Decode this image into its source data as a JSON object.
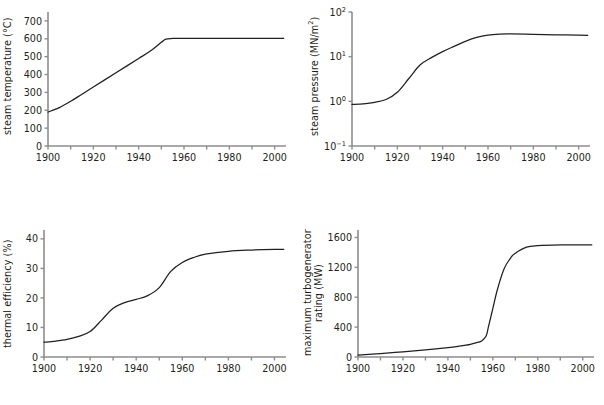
{
  "figure": {
    "caption": "",
    "panel_count": 4
  },
  "chart_data": [
    {
      "id": "steam-temperature",
      "type": "line",
      "title": "",
      "xlabel": "",
      "ylabel": "steam temperature (°C)",
      "xlim": [
        1900,
        2005
      ],
      "ylim": [
        0,
        750
      ],
      "xticks": [
        1900,
        1910,
        1920,
        1930,
        1940,
        1950,
        1960,
        1970,
        1980,
        1990,
        2000
      ],
      "xticklabels": [
        "1900",
        "",
        "1920",
        "",
        "1940",
        "",
        "1960",
        "",
        "1980",
        "",
        "2000"
      ],
      "yticks": [
        0,
        100,
        200,
        300,
        400,
        500,
        600,
        700
      ],
      "yticklabels": [
        "0",
        "100",
        "200",
        "300",
        "400",
        "500",
        "600",
        "700"
      ],
      "yscale": "linear",
      "grid": false,
      "legend": "none",
      "x": [
        1900,
        1905,
        1910,
        1915,
        1920,
        1925,
        1930,
        1935,
        1940,
        1945,
        1950,
        1952,
        1955,
        1960,
        1970,
        1980,
        1990,
        2000,
        2004
      ],
      "y": [
        190,
        215,
        250,
        290,
        330,
        370,
        410,
        450,
        490,
        530,
        580,
        598,
        602,
        603,
        603,
        603,
        603,
        603,
        603
      ]
    },
    {
      "id": "steam-pressure",
      "type": "line",
      "title": "",
      "xlabel": "",
      "ylabel": "steam pressure (MN/m2)",
      "xlim": [
        1900,
        2005
      ],
      "ylim": [
        0.1,
        100
      ],
      "xticks": [
        1900,
        1910,
        1920,
        1930,
        1940,
        1950,
        1960,
        1970,
        1980,
        1990,
        2000
      ],
      "xticklabels": [
        "1900",
        "",
        "1920",
        "",
        "1940",
        "",
        "1960",
        "",
        "1980",
        "",
        "2000"
      ],
      "yticks": [
        0.1,
        1,
        10,
        100
      ],
      "yticklabels": [
        "10-1",
        "100",
        "101",
        "102"
      ],
      "yscale": "log",
      "grid": false,
      "legend": "none",
      "x": [
        1900,
        1905,
        1910,
        1915,
        1920,
        1925,
        1930,
        1935,
        1940,
        1945,
        1950,
        1955,
        1960,
        1965,
        1970,
        1980,
        1990,
        2000,
        2004
      ],
      "y": [
        0.85,
        0.88,
        0.95,
        1.1,
        1.6,
        3.2,
        6.5,
        9.5,
        13,
        17,
        22,
        27,
        30.5,
        32,
        32.2,
        31.5,
        30.8,
        30.2,
        30
      ]
    },
    {
      "id": "thermal-efficiency",
      "type": "line",
      "title": "",
      "xlabel": "",
      "ylabel": "thermal efficiency (%)",
      "xlim": [
        1900,
        2005
      ],
      "ylim": [
        0,
        43
      ],
      "xticks": [
        1900,
        1910,
        1920,
        1930,
        1940,
        1950,
        1960,
        1970,
        1980,
        1990,
        2000
      ],
      "xticklabels": [
        "1900",
        "",
        "1920",
        "",
        "1940",
        "",
        "1960",
        "",
        "1980",
        "",
        "2000"
      ],
      "yticks": [
        0,
        10,
        20,
        30,
        40
      ],
      "yticklabels": [
        "0",
        "10",
        "20",
        "30",
        "40"
      ],
      "yscale": "linear",
      "grid": false,
      "legend": "none",
      "x": [
        1900,
        1905,
        1910,
        1915,
        1920,
        1925,
        1930,
        1935,
        1940,
        1945,
        1950,
        1955,
        1960,
        1965,
        1970,
        1980,
        1990,
        2000,
        2004
      ],
      "y": [
        5.0,
        5.4,
        6.0,
        7.0,
        8.6,
        12.5,
        16.5,
        18.4,
        19.5,
        20.8,
        23.5,
        29.0,
        32.0,
        33.7,
        34.8,
        35.8,
        36.2,
        36.4,
        36.4
      ]
    },
    {
      "id": "turbogenerator-rating",
      "type": "line",
      "title": "",
      "xlabel": "",
      "ylabel": "maximum turbogenerator rating (MW)",
      "ylabel_line1": "maximum turbogenerator",
      "ylabel_line2": "rating (MW)",
      "xlim": [
        1900,
        2005
      ],
      "ylim": [
        0,
        1700
      ],
      "xticks": [
        1900,
        1910,
        1920,
        1930,
        1940,
        1950,
        1960,
        1970,
        1980,
        1990,
        2000
      ],
      "xticklabels": [
        "1900",
        "",
        "1920",
        "",
        "1940",
        "",
        "1960",
        "",
        "1980",
        "",
        "2000"
      ],
      "yticks": [
        0,
        400,
        800,
        1200,
        1600
      ],
      "yticklabels": [
        "0",
        "400",
        "800",
        "1200",
        "1600"
      ],
      "yscale": "linear",
      "grid": false,
      "legend": "none",
      "x": [
        1900,
        1910,
        1920,
        1930,
        1940,
        1945,
        1950,
        1953,
        1955,
        1957,
        1958,
        1960,
        1962,
        1965,
        1968,
        1970,
        1975,
        1980,
        1990,
        2000,
        2004
      ],
      "y": [
        25,
        45,
        70,
        95,
        125,
        145,
        170,
        195,
        215,
        280,
        400,
        650,
        900,
        1180,
        1330,
        1390,
        1470,
        1490,
        1500,
        1500,
        1500
      ]
    }
  ]
}
